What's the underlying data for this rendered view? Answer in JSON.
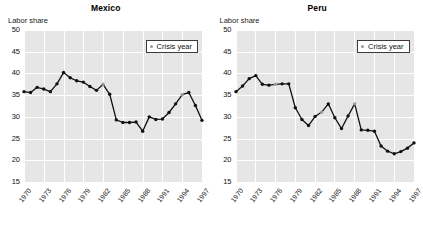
{
  "figure": {
    "y_axis_caption": "Labor share",
    "legend_label": "Crisis year",
    "legend_marker": "crisis-year-dot",
    "colors": {
      "plot_background": "#e6e6e6",
      "gridline": "#ffffff",
      "line": "#111111",
      "marker": "#111111",
      "crisis_marker": "#9a9a9a",
      "text": "#111111"
    }
  },
  "chart_data": [
    {
      "type": "line",
      "title": "Mexico",
      "xlabel": "",
      "ylabel": "Labor share",
      "ylim": [
        15,
        50
      ],
      "yticks": [
        15,
        20,
        25,
        30,
        35,
        40,
        45,
        50
      ],
      "xlim": [
        1970,
        1997
      ],
      "xticks": [
        1970,
        1973,
        1976,
        1979,
        1982,
        1985,
        1988,
        1991,
        1994,
        1997
      ],
      "grid": true,
      "legend": {
        "position": "top-right",
        "entries": [
          "Crisis year"
        ]
      },
      "x": [
        1970,
        1971,
        1972,
        1973,
        1974,
        1975,
        1976,
        1977,
        1978,
        1979,
        1980,
        1981,
        1982,
        1983,
        1984,
        1985,
        1986,
        1987,
        1988,
        1989,
        1990,
        1991,
        1992,
        1993,
        1994,
        1995,
        1996,
        1997
      ],
      "values": [
        35.8,
        35.6,
        36.8,
        36.4,
        35.8,
        37.6,
        40.2,
        39.0,
        38.3,
        38.0,
        37.0,
        36.1,
        37.5,
        35.2,
        29.3,
        28.7,
        28.7,
        28.8,
        26.7,
        30.0,
        29.4,
        29.5,
        31.0,
        33.0,
        35.1,
        35.6,
        32.6,
        29.2
      ],
      "crisis_years": [
        1982,
        1994
      ],
      "series": [
        {
          "name": "Labor share",
          "values": [
            35.8,
            35.6,
            36.8,
            36.4,
            35.8,
            37.6,
            40.2,
            39.0,
            38.3,
            38.0,
            37.0,
            36.1,
            37.5,
            35.2,
            29.3,
            28.7,
            28.7,
            28.8,
            26.7,
            30.0,
            29.4,
            29.5,
            31.0,
            33.0,
            35.1,
            35.6,
            32.6,
            29.2
          ]
        }
      ]
    },
    {
      "type": "line",
      "title": "Peru",
      "xlabel": "",
      "ylabel": "Labor share",
      "ylim": [
        15,
        50
      ],
      "yticks": [
        15,
        20,
        25,
        30,
        35,
        40,
        45,
        50
      ],
      "xlim": [
        1970,
        1997
      ],
      "xticks": [
        1970,
        1973,
        1976,
        1979,
        1982,
        1985,
        1988,
        1991,
        1994,
        1997
      ],
      "grid": true,
      "legend": {
        "position": "top-right",
        "entries": [
          "Crisis year"
        ]
      },
      "x": [
        1970,
        1971,
        1972,
        1973,
        1974,
        1975,
        1976,
        1977,
        1978,
        1979,
        1980,
        1981,
        1982,
        1983,
        1984,
        1985,
        1986,
        1987,
        1988,
        1989,
        1990,
        1991,
        1992,
        1993,
        1994,
        1995,
        1996,
        1997
      ],
      "values": [
        35.8,
        37.1,
        38.8,
        39.5,
        37.5,
        37.3,
        37.5,
        37.6,
        37.6,
        32.1,
        29.4,
        28.0,
        30.1,
        31.1,
        33.0,
        29.8,
        27.3,
        30.2,
        33.0,
        27.0,
        26.9,
        26.7,
        23.3,
        22.1,
        21.5,
        22.0,
        22.8,
        24.0
      ],
      "crisis_years": [
        1976,
        1983,
        1988
      ],
      "series": [
        {
          "name": "Labor share",
          "values": [
            35.8,
            37.1,
            38.8,
            39.5,
            37.5,
            37.3,
            37.5,
            37.6,
            37.6,
            32.1,
            29.4,
            28.0,
            30.1,
            31.1,
            33.0,
            29.8,
            27.3,
            30.2,
            33.0,
            27.0,
            26.9,
            26.7,
            23.3,
            22.1,
            21.5,
            22.0,
            22.8,
            24.0
          ]
        }
      ]
    }
  ]
}
